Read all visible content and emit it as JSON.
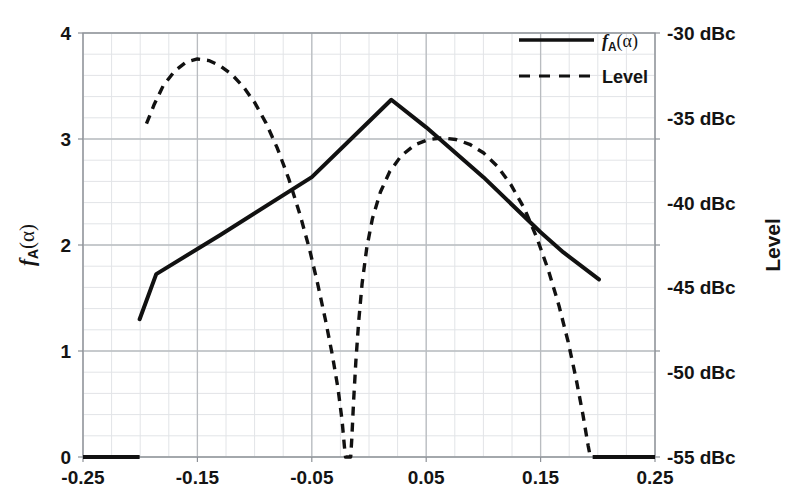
{
  "chart_data": {
    "type": "line",
    "title": "",
    "xlabel": "",
    "ylabel": "fA(alpha)",
    "ylabel_right": "Level",
    "xlim": [
      -0.25,
      0.25
    ],
    "ylim": [
      0,
      4
    ],
    "ylim_right": [
      -55,
      -30
    ],
    "grid": true,
    "grid_minor_x_step": 0.025,
    "grid_minor_y_step": 0.2,
    "x_ticks": [
      -0.25,
      -0.15,
      -0.05,
      0.05,
      0.15,
      0.25
    ],
    "x_tick_labels": [
      "-0.25",
      "-0.15",
      "-0.05",
      "0.05",
      "0.15",
      "0.25"
    ],
    "y_ticks": [
      0,
      1,
      2,
      3,
      4
    ],
    "y_tick_labels": [
      "0",
      "1",
      "2",
      "3",
      "4"
    ],
    "y_right_ticks": [
      -55,
      -50,
      -45,
      -40,
      -35,
      -30
    ],
    "y_right_tick_labels": [
      "-55 dBc",
      "-50 dBc",
      "-45 dBc",
      "-40 dBc",
      "-45 dBc",
      "-30 dBc"
    ],
    "y_right_tick_labels_ordered": [
      "-30 dBc",
      "-35 dBc",
      "-40 dBc",
      "-45 dBc",
      "-50 dBc",
      "-55 dBc"
    ],
    "legend_position": "top-right",
    "series": [
      {
        "name": "fA(alpha)",
        "style": "solid",
        "color": "#111111",
        "axis": "left",
        "points": [
          [
            -0.2005,
            1.3
          ],
          [
            -0.186,
            1.725
          ],
          [
            -0.13,
            2.095
          ],
          [
            -0.05,
            2.64
          ],
          [
            0.0,
            3.165
          ],
          [
            0.0195,
            3.37
          ],
          [
            0.05,
            3.11
          ],
          [
            0.1,
            2.64
          ],
          [
            0.15,
            2.12
          ],
          [
            0.17,
            1.93
          ],
          [
            0.201,
            1.675
          ]
        ]
      },
      {
        "name": "Level",
        "style": "dashed",
        "color": "#111111",
        "axis": "right",
        "points": [
          [
            -0.1945,
            3.145
          ],
          [
            -0.188,
            3.32
          ],
          [
            -0.18,
            3.5
          ],
          [
            -0.17,
            3.64
          ],
          [
            -0.16,
            3.725
          ],
          [
            -0.15,
            3.755
          ],
          [
            -0.14,
            3.74
          ],
          [
            -0.13,
            3.69
          ],
          [
            -0.12,
            3.61
          ],
          [
            -0.11,
            3.495
          ],
          [
            -0.1,
            3.345
          ],
          [
            -0.09,
            3.15
          ],
          [
            -0.08,
            2.91
          ],
          [
            -0.07,
            2.62
          ],
          [
            -0.06,
            2.275
          ],
          [
            -0.052,
            1.96
          ],
          [
            -0.045,
            1.64
          ],
          [
            -0.038,
            1.29
          ],
          [
            -0.032,
            0.96
          ],
          [
            -0.027,
            0.64
          ],
          [
            -0.0235,
            0.34
          ],
          [
            -0.0215,
            0.1
          ],
          [
            -0.0205,
            0.0
          ],
          [
            -0.016,
            0.0
          ],
          [
            -0.015,
            0.18
          ],
          [
            -0.0135,
            0.52
          ],
          [
            -0.0115,
            0.9
          ],
          [
            -0.009,
            1.28
          ],
          [
            -0.006,
            1.64
          ],
          [
            -0.002,
            1.97
          ],
          [
            0.003,
            2.25
          ],
          [
            0.01,
            2.5
          ],
          [
            0.018,
            2.69
          ],
          [
            0.028,
            2.84
          ],
          [
            0.04,
            2.945
          ],
          [
            0.052,
            2.995
          ],
          [
            0.064,
            3.01
          ],
          [
            0.076,
            2.995
          ],
          [
            0.088,
            2.95
          ],
          [
            0.1,
            2.87
          ],
          [
            0.112,
            2.745
          ],
          [
            0.124,
            2.57
          ],
          [
            0.136,
            2.34
          ],
          [
            0.147,
            2.06
          ],
          [
            0.157,
            1.755
          ],
          [
            0.166,
            1.43
          ],
          [
            0.174,
            1.09
          ],
          [
            0.181,
            0.74
          ],
          [
            0.187,
            0.4
          ],
          [
            0.1915,
            0.11
          ],
          [
            0.1935,
            0.0
          ]
        ]
      }
    ],
    "baseline_segments": [
      {
        "name": "left-baseline",
        "x_start": -0.25,
        "x_end": -0.2005,
        "y": 0
      },
      {
        "name": "right-baseline",
        "x_start": 0.1955,
        "x_end": 0.25,
        "y": 0
      }
    ]
  },
  "legend": {
    "items": [
      {
        "label_f": "f",
        "label_sub": "A",
        "label_arg": "(α)",
        "style": "solid"
      },
      {
        "label": "Level",
        "style": "dashed"
      }
    ]
  },
  "axes": {
    "left_title_f": "f",
    "left_title_sub": "A",
    "left_title_arg": "(α)",
    "right_title": "Level"
  },
  "colors": {
    "line": "#111111",
    "grid_major": "#b9bcc0",
    "grid_minor": "#e2e4e7",
    "frame": "#8d9197",
    "text": "#141414",
    "background": "#ffffff"
  }
}
